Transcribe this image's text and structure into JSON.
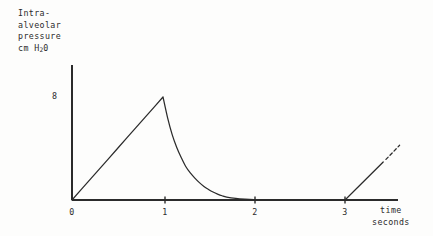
{
  "figure": {
    "background_color": "#fdfdfc",
    "ink_color": "#2b2b2b",
    "y_axis_title_lines": [
      "Intra-",
      "alveolar",
      "pressure",
      "cm  H"
    ],
    "y_axis_title_subscript": "2",
    "y_axis_title_tail": "0",
    "x_axis_caption_lines": [
      "time",
      "seconds"
    ]
  },
  "chart_data": {
    "type": "line",
    "xlabel": "time seconds",
    "ylabel": "Intra-alveolar pressure cm H20",
    "xlim": [
      0,
      4
    ],
    "ylim": [
      0,
      9.2
    ],
    "grid": false,
    "legend": null,
    "xticks": [
      0,
      1,
      2,
      3
    ],
    "xticklabels": [
      "0",
      "1",
      "2",
      "3"
    ],
    "yticks": [
      8
    ],
    "yticklabels": [
      "8"
    ],
    "annotations": [
      "linear rise from origin to peak of 8 at t = 1 s",
      "exponential decay from peak back to baseline by t ~ 1.7 s",
      "flat baseline at 0 from t ~ 1.7 s to t = 3 s",
      "second linear rise beginning at t = 3 s, continued as a dashed line"
    ],
    "series": [
      {
        "name": "intra-alveolar pressure",
        "style": "solid",
        "x": [
          0,
          0.1,
          0.2,
          0.3,
          0.4,
          0.5,
          0.6,
          0.7,
          0.8,
          0.9,
          1.0,
          1.05,
          1.1,
          1.15,
          1.2,
          1.25,
          1.3,
          1.35,
          1.4,
          1.45,
          1.5,
          1.55,
          1.6,
          1.65,
          1.7,
          1.8,
          1.9,
          2.0,
          2.2,
          2.4,
          2.6,
          2.8,
          3.0
        ],
        "y": [
          0,
          0.8,
          1.6,
          2.4,
          3.2,
          4.0,
          4.8,
          5.6,
          6.4,
          7.2,
          8.0,
          6.4,
          5.1,
          4.1,
          3.3,
          2.6,
          2.1,
          1.7,
          1.35,
          1.05,
          0.82,
          0.62,
          0.46,
          0.33,
          0.23,
          0.12,
          0.06,
          0.03,
          0.01,
          0.0,
          0.0,
          0.0,
          0.0
        ]
      },
      {
        "name": "next breath onset",
        "style": "solid",
        "x": [
          3.0,
          3.42
        ],
        "y": [
          0,
          2.95
        ]
      },
      {
        "name": "next breath continuation",
        "style": "dashed",
        "x": [
          3.45,
          3.6
        ],
        "y": [
          3.15,
          4.25
        ]
      }
    ]
  },
  "x_ticks": [
    {
      "label": "0",
      "value": 0,
      "px": 72
    },
    {
      "label": "1",
      "value": 1,
      "px": 165
    },
    {
      "label": "2",
      "value": 2,
      "px": 255
    },
    {
      "label": "3",
      "value": 3,
      "px": 345
    }
  ],
  "y_ticks": [
    {
      "label": "8",
      "value": 8,
      "px": 97
    }
  ]
}
